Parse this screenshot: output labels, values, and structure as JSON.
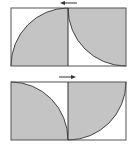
{
  "diagram": {
    "colors": {
      "fill": "#c4c4c4",
      "stroke": "#444444",
      "background": "#ffffff"
    },
    "panels": [
      {
        "id": "top",
        "arrow_direction": "left"
      },
      {
        "id": "bottom",
        "arrow_direction": "right"
      }
    ]
  }
}
